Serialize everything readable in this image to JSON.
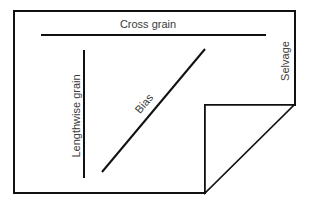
{
  "diagram": {
    "labels": {
      "cross_grain": "Cross grain",
      "lengthwise_grain": "Lengthwise grain",
      "bias": "Bias",
      "selvage": "Selvage"
    },
    "colors": {
      "stroke": "#111111",
      "text": "#3a3a3a",
      "background": "#ffffff"
    }
  }
}
